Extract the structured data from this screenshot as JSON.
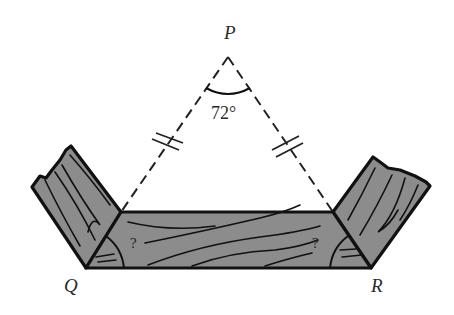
{
  "labels": {
    "apex": "P",
    "left_vertex": "Q",
    "right_vertex": "R",
    "apex_angle": "72°",
    "left_unknown": "?",
    "right_unknown": "?"
  },
  "figure": {
    "equal_sides": [
      "PQ",
      "PR"
    ],
    "apex_angle_degrees": 72,
    "colors": {
      "wood_fill": "#8c8c8c",
      "outline": "#111111",
      "label": "#2b2b2b"
    }
  }
}
